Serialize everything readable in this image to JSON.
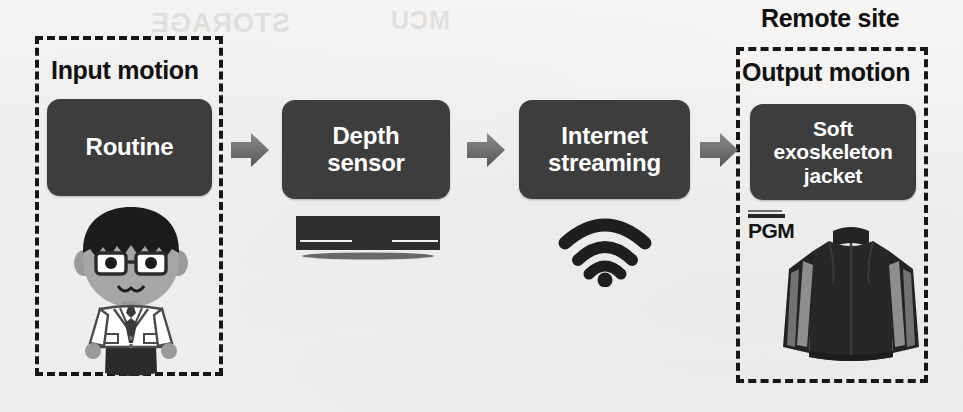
{
  "diagram": {
    "title_visible": false,
    "background_color": "#f2f1ef",
    "box_color": "#3d3d3d",
    "box_text_color": "#ffffff",
    "dash_color": "#171717",
    "arrow_color": "#6b6b6b"
  },
  "groups": [
    {
      "id": "input-motion",
      "caption": "Input motion",
      "caption_position": "inside-top"
    },
    {
      "id": "remote-site",
      "caption": "Remote site",
      "caption_position": "outside-top"
    },
    {
      "id": "output-motion",
      "caption": "Output motion",
      "caption_position": "inside-top"
    }
  ],
  "stages": [
    {
      "id": "routine",
      "label": "Routine",
      "lines": [
        "Routine"
      ]
    },
    {
      "id": "depth",
      "label": "Depth sensor",
      "lines": [
        "Depth",
        "sensor"
      ]
    },
    {
      "id": "streaming",
      "label": "Internet streaming",
      "lines": [
        "Internet",
        "streaming"
      ]
    },
    {
      "id": "jacket",
      "label": "Soft exoskeleton jacket",
      "lines": [
        "Soft",
        "exoskeleton",
        "jacket"
      ]
    }
  ],
  "arrows": [
    {
      "id": "arrow-1",
      "from": "routine",
      "to": "depth",
      "direction": "right"
    },
    {
      "id": "arrow-2",
      "from": "depth",
      "to": "streaming",
      "direction": "right"
    },
    {
      "id": "arrow-3",
      "from": "streaming",
      "to": "jacket",
      "direction": "right"
    }
  ],
  "illustrations": [
    {
      "id": "person",
      "description": "person-in-lab-coat"
    },
    {
      "id": "depth-sensor",
      "description": "depth-sensor-bar"
    },
    {
      "id": "wifi",
      "description": "wifi-signal"
    },
    {
      "id": "jacket",
      "description": "exoskeleton-jacket"
    }
  ],
  "brand": {
    "pgm_label": "PGM"
  },
  "ghost_text": {
    "left": "STORAGE",
    "right": "MCU"
  }
}
